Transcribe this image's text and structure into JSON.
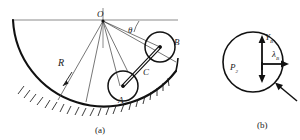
{
  "figure": {
    "kind": "mechanics-diagram",
    "panels": [
      {
        "id": "a",
        "caption": "(a)",
        "description": "Two circular bodies A and B connected by rod C resting inside a fixed circular arc of radius R centred at O",
        "labels": {
          "center": "O",
          "angle": "θ",
          "radius": "R",
          "body_lower": "A",
          "body_upper": "B",
          "rod": "C"
        }
      },
      {
        "id": "b",
        "caption": "(b)",
        "description": "Free body diagram of body B showing reaction components and weight",
        "labels": {
          "vertical_force": "Y",
          "vertical_force_sub": "B",
          "horizontal_force": "λ",
          "horizontal_force_sub": "B",
          "weight": "P",
          "weight_sub": "2"
        }
      }
    ],
    "colors": {
      "ink": "#1a1a1a",
      "thin_line": "#4a4a4a",
      "background": "#ffffff"
    }
  }
}
